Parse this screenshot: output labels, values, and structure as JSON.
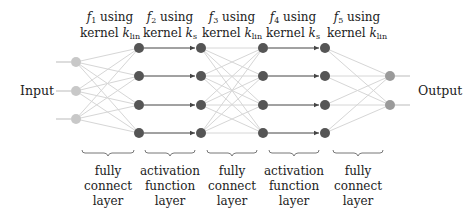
{
  "diagram": {
    "type": "neural-network-architecture",
    "input_label": "Input",
    "output_label": "Output",
    "columns": [
      {
        "id": "input",
        "nodes": 3,
        "x": 76,
        "color": "#c8c8c8"
      },
      {
        "id": "h1",
        "nodes": 4,
        "x": 139,
        "color": "#555555"
      },
      {
        "id": "h2",
        "nodes": 4,
        "x": 201,
        "color": "#555555"
      },
      {
        "id": "h3",
        "nodes": 4,
        "x": 263,
        "color": "#555555"
      },
      {
        "id": "h4",
        "nodes": 4,
        "x": 325,
        "color": "#555555"
      },
      {
        "id": "output",
        "nodes": 2,
        "x": 390,
        "color": "#9a9a9a"
      }
    ],
    "functions": [
      {
        "fn": "f",
        "sub": "1",
        "line1_rest": " using",
        "line2_prefix": "kernel ",
        "kernel": "k",
        "ksub": "lin"
      },
      {
        "fn": "f",
        "sub": "2",
        "line1_rest": " using",
        "line2_prefix": "kernel ",
        "kernel": "k",
        "ksub": "s"
      },
      {
        "fn": "f",
        "sub": "3",
        "line1_rest": " using",
        "line2_prefix": "kernel ",
        "kernel": "k",
        "ksub": "lin"
      },
      {
        "fn": "f",
        "sub": "4",
        "line1_rest": " using",
        "line2_prefix": "kernel ",
        "kernel": "k",
        "ksub": "s"
      },
      {
        "fn": "f",
        "sub": "5",
        "line1_rest": " using",
        "line2_prefix": "kernel ",
        "kernel": "k",
        "ksub": "lin"
      }
    ],
    "layers": [
      {
        "type": "fully-connected",
        "lines": [
          "fully",
          "connect",
          "layer"
        ]
      },
      {
        "type": "activation",
        "lines": [
          "activation",
          "function",
          "layer"
        ]
      },
      {
        "type": "fully-connected",
        "lines": [
          "fully",
          "connect",
          "layer"
        ]
      },
      {
        "type": "activation",
        "lines": [
          "activation",
          "function",
          "layer"
        ]
      },
      {
        "type": "fully-connected",
        "lines": [
          "fully",
          "connect",
          "layer"
        ]
      }
    ],
    "colors": {
      "input_node": "#c8c8c8",
      "hidden_node": "#555555",
      "output_node": "#9a9a9a",
      "dense_edge": "#d6d6d6",
      "activation_arrow": "#444444",
      "brace": "#777777"
    }
  }
}
